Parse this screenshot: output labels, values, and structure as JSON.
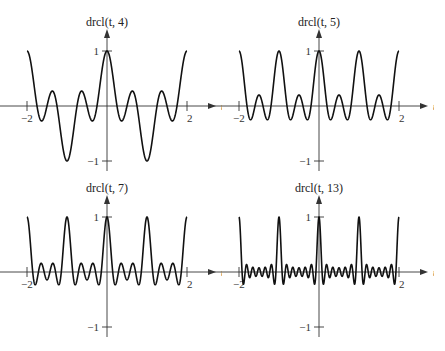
{
  "figure": {
    "background": "#ffffff",
    "curve_color": "#111111",
    "axis_color": "#333333"
  },
  "chart_data": [
    {
      "type": "line",
      "title": "drcl(t, 4)",
      "function": "drcl(t, N) = sin(pi N t) / (N sin(pi t))",
      "N": 4,
      "xlabel": "t",
      "ylabel": "",
      "xlim": [
        -2,
        2
      ],
      "ylim": [
        -1,
        1
      ],
      "x_ticks": [
        {
          "value": -2,
          "label": "−2"
        },
        {
          "value": 2,
          "label": "2"
        }
      ],
      "y_ticks": [
        {
          "value": 1,
          "label": "1"
        },
        {
          "value": -1,
          "label": "−1"
        }
      ],
      "grid": false,
      "legend": "none"
    },
    {
      "type": "line",
      "title": "drcl(t, 5)",
      "function": "drcl(t, N) = sin(pi N t) / (N sin(pi t))",
      "N": 5,
      "xlabel": "t",
      "ylabel": "",
      "xlim": [
        -2,
        2
      ],
      "ylim": [
        -1,
        1
      ],
      "x_ticks": [
        {
          "value": -2,
          "label": "−2"
        },
        {
          "value": 2,
          "label": "2"
        }
      ],
      "y_ticks": [
        {
          "value": 1,
          "label": "1"
        },
        {
          "value": -1,
          "label": "−1"
        }
      ],
      "grid": false,
      "legend": "none"
    },
    {
      "type": "line",
      "title": "drcl(t, 7)",
      "function": "drcl(t, N) = sin(pi N t) / (N sin(pi t))",
      "N": 7,
      "xlabel": "t",
      "ylabel": "",
      "xlim": [
        -2,
        2
      ],
      "ylim": [
        -1,
        1
      ],
      "x_ticks": [
        {
          "value": -2,
          "label": "−2"
        },
        {
          "value": 2,
          "label": "2"
        }
      ],
      "y_ticks": [
        {
          "value": 1,
          "label": "1"
        },
        {
          "value": -1,
          "label": "−1"
        }
      ],
      "grid": false,
      "legend": "none"
    },
    {
      "type": "line",
      "title": "drcl(t, 13)",
      "function": "drcl(t, N) = sin(pi N t) / (N sin(pi t))",
      "N": 13,
      "xlabel": "t",
      "ylabel": "",
      "xlim": [
        -2,
        2
      ],
      "ylim": [
        -1,
        1
      ],
      "x_ticks": [
        {
          "value": -2,
          "label": "−2"
        },
        {
          "value": 2,
          "label": "2"
        }
      ],
      "y_ticks": [
        {
          "value": 1,
          "label": "1"
        },
        {
          "value": -1,
          "label": "−1"
        }
      ],
      "grid": false,
      "legend": "none"
    }
  ]
}
